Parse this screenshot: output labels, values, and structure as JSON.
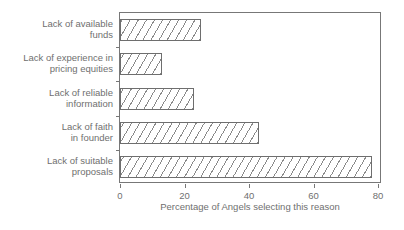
{
  "chart_data": {
    "type": "bar",
    "orientation": "horizontal",
    "title": "",
    "subtitle": "",
    "xlabel": "Percentage of Angels selecting this reason",
    "ylabel": "",
    "categories": [
      "Lack of available funds",
      "Lack of experience in pricing equities",
      "Lack of reliable information",
      "Lack of faith in founder",
      "Lack of suitable proposals"
    ],
    "category_lines": [
      [
        "Lack of available",
        "funds"
      ],
      [
        "Lack of experience in",
        "pricing equities"
      ],
      [
        "Lack of reliable",
        "information"
      ],
      [
        "Lack of faith",
        "in founder"
      ],
      [
        "Lack of suitable",
        "proposals"
      ]
    ],
    "values": [
      25,
      13,
      23,
      43,
      78
    ],
    "xlim": [
      0,
      80
    ],
    "xticks": [
      0,
      20,
      40,
      60,
      80
    ],
    "xticklabels": [
      "0",
      "20",
      "40",
      "60",
      "80"
    ],
    "grid": false,
    "legend": false,
    "bar_fill": "#ffffff",
    "bar_hatch": "/",
    "bar_edge_color": "#6e6e6e",
    "axis_color": "#777777",
    "text_color": "#6f6f6f",
    "background": "#ffffff"
  }
}
